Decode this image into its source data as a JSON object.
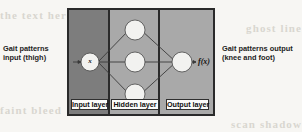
{
  "diagram": {
    "type": "neural-network",
    "panels": [
      {
        "id": "input",
        "layer_tag": "Input layer",
        "node_count": 1,
        "fill": "#7d7d7d"
      },
      {
        "id": "hidden",
        "layer_tag": "Hidden layer",
        "node_count": 3,
        "fill": "#a9a9a9"
      },
      {
        "id": "output",
        "layer_tag": "Output layer",
        "node_count": 1,
        "fill": "#a9a9a9"
      }
    ],
    "input_node_label": "x",
    "output_function_label": "f(x)",
    "frame_border_color": "#2a2a2a",
    "node_fill_color": "#f2f2f0",
    "connection_color": "#3a3a3a"
  },
  "captions": {
    "left": "Gait patterns input (thigh)",
    "right": "Gait patterns output (knee and foot)"
  },
  "scan_artifacts": {
    "ghost_top_left": "the text here",
    "ghost_top_right": "ghost line",
    "ghost_bottom_left": "faint bleed",
    "ghost_bottom_right": "scan shadow"
  }
}
